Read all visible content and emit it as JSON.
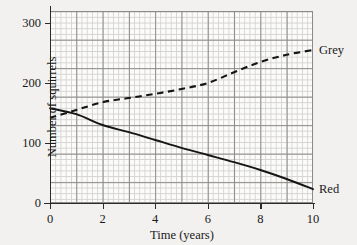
{
  "chart_data": {
    "type": "line",
    "title": "",
    "xlabel": "Time (years)",
    "ylabel": "Number of squirrels",
    "xlim": [
      0,
      10
    ],
    "ylim": [
      0,
      320
    ],
    "xticks": [
      0,
      2,
      4,
      6,
      8,
      10
    ],
    "xtick_labels": [
      "0",
      "2",
      "4",
      "6",
      "8",
      "10"
    ],
    "yticks": [
      0,
      100,
      200,
      300
    ],
    "ytick_labels": [
      "0",
      "100",
      "200",
      "300"
    ],
    "grid": "major and minor",
    "legend_position": "right-of-line-ends",
    "series": [
      {
        "name": "Grey",
        "label": "Grey",
        "style": "dashed",
        "color": "#151515",
        "x": [
          0,
          1,
          2,
          3,
          4,
          5,
          6,
          7,
          8,
          9,
          10
        ],
        "values": [
          142,
          155,
          168,
          175,
          182,
          190,
          200,
          218,
          235,
          247,
          255
        ]
      },
      {
        "name": "Red",
        "label": "Red",
        "style": "solid",
        "color": "#151515",
        "x": [
          0,
          1,
          2,
          3,
          4,
          5,
          6,
          7,
          8,
          9,
          10
        ],
        "values": [
          158,
          148,
          130,
          118,
          105,
          92,
          80,
          68,
          55,
          40,
          23
        ]
      }
    ]
  },
  "axes": {
    "x_title": "Time (years)",
    "y_title": "Number of squirrels"
  },
  "labels": {
    "grey": "Grey",
    "red": "Red"
  }
}
